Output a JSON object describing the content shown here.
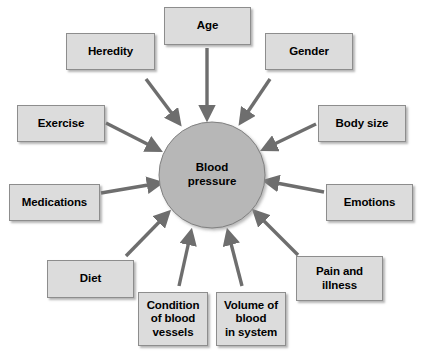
{
  "diagram": {
    "type": "radial-influence-diagram",
    "colors": {
      "box_fill": "#dcdcdc",
      "box_border": "#8d8d8d",
      "hub_fill": "#b7b7b7",
      "hub_border": "#808080",
      "arrow": "#6e6e6e",
      "text": "#000000",
      "background": "#ffffff"
    },
    "hub": {
      "label": "Blood\npressure",
      "cx": 212,
      "cy": 175,
      "r": 53
    },
    "nodes": [
      {
        "id": "age",
        "label": "Age",
        "x": 164,
        "y": 7,
        "w": 87,
        "h": 38
      },
      {
        "id": "heredity",
        "label": "Heredity",
        "x": 66,
        "y": 33,
        "w": 89,
        "h": 37
      },
      {
        "id": "gender",
        "label": "Gender",
        "x": 265,
        "y": 33,
        "w": 88,
        "h": 37
      },
      {
        "id": "exercise",
        "label": "Exercise",
        "x": 17,
        "y": 105,
        "w": 88,
        "h": 37
      },
      {
        "id": "body-size",
        "label": "Body size",
        "x": 318,
        "y": 105,
        "w": 88,
        "h": 37
      },
      {
        "id": "medications",
        "label": "Medications",
        "x": 9,
        "y": 184,
        "w": 91,
        "h": 37
      },
      {
        "id": "emotions",
        "label": "Emotions",
        "x": 326,
        "y": 184,
        "w": 87,
        "h": 37
      },
      {
        "id": "diet",
        "label": "Diet",
        "x": 47,
        "y": 260,
        "w": 87,
        "h": 38
      },
      {
        "id": "pain-illness",
        "label": "Pain and\nillness",
        "x": 296,
        "y": 256,
        "w": 87,
        "h": 45
      },
      {
        "id": "condition-blood-vessels",
        "label": "Condition\nof blood\nvessels",
        "x": 138,
        "y": 292,
        "w": 70,
        "h": 54
      },
      {
        "id": "volume-blood-in-system",
        "label": "Volume of\nblood\nin system",
        "x": 216,
        "y": 292,
        "w": 70,
        "h": 54
      }
    ],
    "arrows": [
      {
        "from": "age",
        "x1": 207,
        "y1": 48,
        "x2": 207,
        "y2": 118
      },
      {
        "from": "heredity",
        "x1": 146,
        "y1": 79,
        "x2": 179,
        "y2": 123
      },
      {
        "from": "gender",
        "x1": 270,
        "y1": 79,
        "x2": 241,
        "y2": 122
      },
      {
        "from": "exercise",
        "x1": 106,
        "y1": 123,
        "x2": 159,
        "y2": 150
      },
      {
        "from": "body-size",
        "x1": 316,
        "y1": 124,
        "x2": 264,
        "y2": 149
      },
      {
        "from": "medications",
        "x1": 101,
        "y1": 193,
        "x2": 160,
        "y2": 183
      },
      {
        "from": "emotions",
        "x1": 324,
        "y1": 192,
        "x2": 266,
        "y2": 181
      },
      {
        "from": "diet",
        "x1": 126,
        "y1": 256,
        "x2": 168,
        "y2": 213
      },
      {
        "from": "pain-illness",
        "x1": 298,
        "y1": 255,
        "x2": 255,
        "y2": 212
      },
      {
        "from": "condition-blood-vessels",
        "x1": 179,
        "y1": 286,
        "x2": 191,
        "y2": 232
      },
      {
        "from": "volume-blood-in-system",
        "x1": 242,
        "y1": 286,
        "x2": 228,
        "y2": 232
      }
    ]
  }
}
